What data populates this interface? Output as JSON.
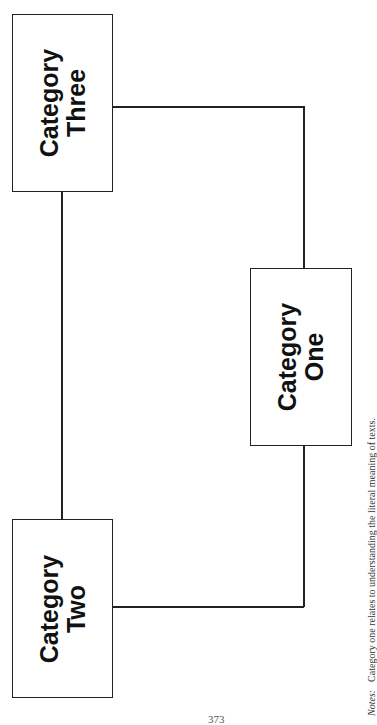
{
  "diagram": {
    "nodes": [
      {
        "id": "three",
        "line1": "Category",
        "line2": "Three"
      },
      {
        "id": "one",
        "line1": "Category",
        "line2": "One"
      },
      {
        "id": "two",
        "line1": "Category",
        "line2": "Two"
      }
    ],
    "edges": [
      {
        "from": "three",
        "to": "two"
      },
      {
        "from": "three",
        "to": "one"
      },
      {
        "from": "two",
        "to": "one"
      }
    ]
  },
  "notes": {
    "label": "Notes:",
    "text": "Category one relates to understanding the literal meaning of texts."
  },
  "page_number": "373"
}
